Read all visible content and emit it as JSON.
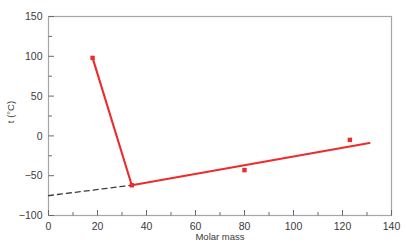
{
  "chart_data": {
    "type": "line",
    "title": "",
    "xlabel": "Molar mass",
    "ylabel": "t (°C)",
    "xlim": [
      0,
      140
    ],
    "ylim": [
      -100,
      150
    ],
    "xticks": [
      0,
      20,
      40,
      60,
      80,
      100,
      120,
      140
    ],
    "xtick_labels": [
      "0",
      "20",
      "40",
      "60",
      "80",
      "100",
      "120",
      "140"
    ],
    "yticks": [
      -100,
      -50,
      0,
      50,
      100,
      150
    ],
    "ytick_labels": [
      "-100",
      "-50",
      "0",
      "50",
      "100",
      "150"
    ],
    "x_minor_step": 10,
    "y_minor_step": 25,
    "grid": false,
    "legend": null,
    "series": [
      {
        "name": "boiling points",
        "type": "scatter+line",
        "color": "#ee2b2b",
        "marker": "square",
        "x": [
          18,
          34,
          80,
          123
        ],
        "y": [
          98,
          -62,
          -43,
          -5
        ],
        "points": [
          {
            "x": 18,
            "y": 98
          },
          {
            "x": 34,
            "y": -62
          },
          {
            "x": 80,
            "y": -43
          },
          {
            "x": 123,
            "y": -5
          }
        ]
      },
      {
        "name": "trend line",
        "type": "line",
        "color": "#ee2b2b",
        "style": "solid",
        "x": [
          18,
          34,
          131
        ],
        "y": [
          98,
          -62,
          -9
        ]
      },
      {
        "name": "extrapolation",
        "type": "line",
        "color": "#3c3c3c",
        "style": "dashed",
        "x": [
          0,
          34
        ],
        "y": [
          -75,
          -62
        ]
      }
    ]
  },
  "figure": {
    "frame_color": "#a6a6aa",
    "background": "#ffffff",
    "cut_caption": "",
    "axis_text_color": "#3a3a3a"
  }
}
